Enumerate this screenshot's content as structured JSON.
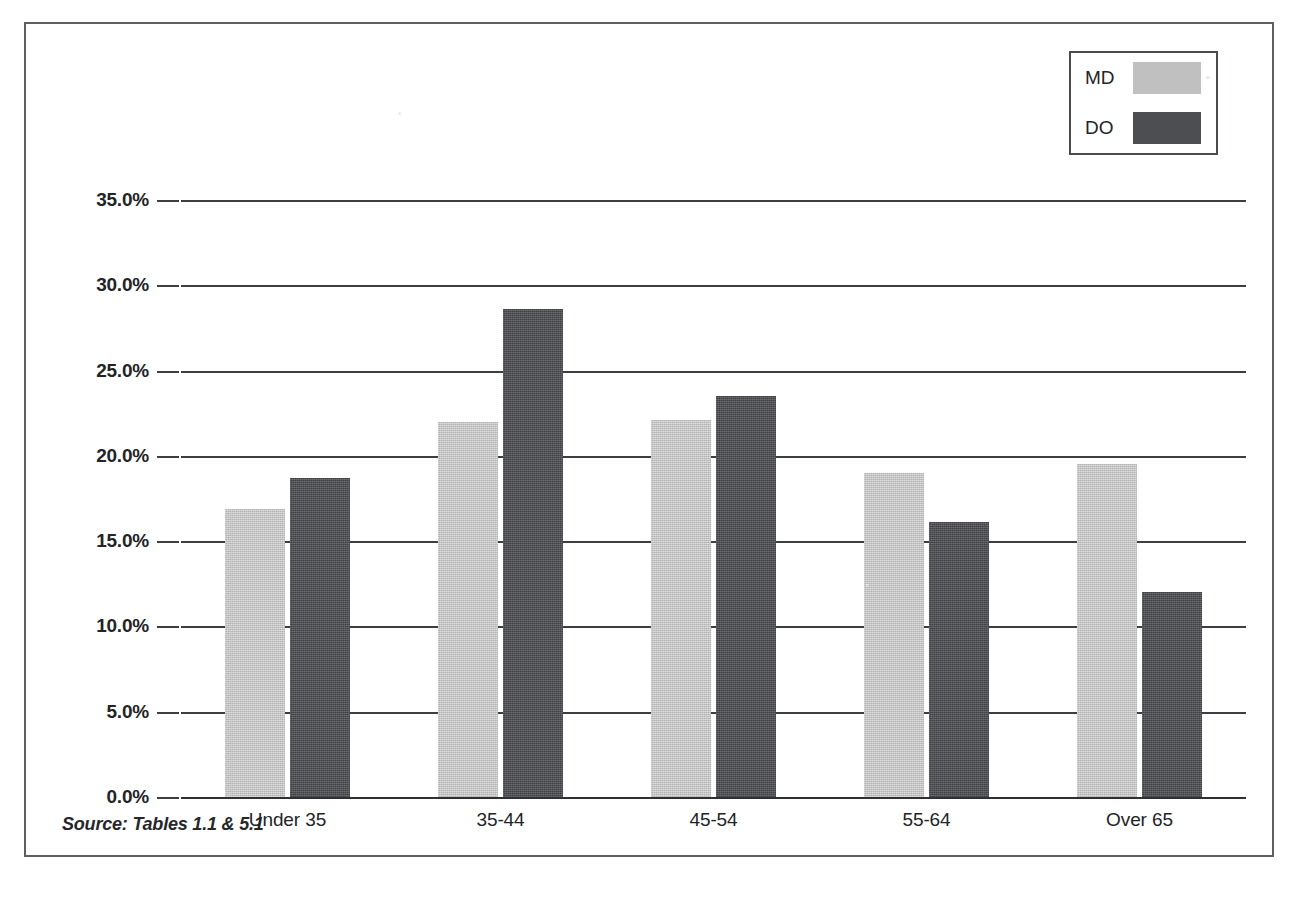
{
  "figure": {
    "clipped_title_ghost": "",
    "source_note": "Source: Tables 1.1 & 5.1"
  },
  "legend": {
    "position": "top-right",
    "items": [
      {
        "label": "MD",
        "color": "#c0c0c0"
      },
      {
        "label": "DO",
        "color": "#4c4e52"
      }
    ]
  },
  "colors": {
    "md": "#c0c0c0",
    "do": "#4c4e52",
    "axis": "#3c3e43",
    "frame": "#5d5f64",
    "text": "#232427"
  },
  "chart_data": {
    "type": "bar",
    "title": "",
    "xlabel": "",
    "ylabel": "",
    "ylim": [
      0,
      35
    ],
    "ytick_step": 5,
    "grid": true,
    "legend_position": "top-right",
    "value_format": "percent",
    "categories": [
      "Under 35",
      "35-44",
      "45-54",
      "55-64",
      "Over 65"
    ],
    "ytick_labels": [
      "0.0%",
      "5.0%",
      "10.0%",
      "15.0%",
      "20.0%",
      "25.0%",
      "30.0%",
      "35.0%"
    ],
    "ytick_values": [
      0,
      5,
      10,
      15,
      20,
      25,
      30,
      35
    ],
    "series": [
      {
        "name": "MD",
        "color": "#c0c0c0",
        "values": [
          16.9,
          22.0,
          22.1,
          19.0,
          19.5
        ]
      },
      {
        "name": "DO",
        "color": "#4c4e52",
        "values": [
          18.7,
          28.6,
          23.5,
          16.1,
          12.0
        ]
      }
    ]
  }
}
